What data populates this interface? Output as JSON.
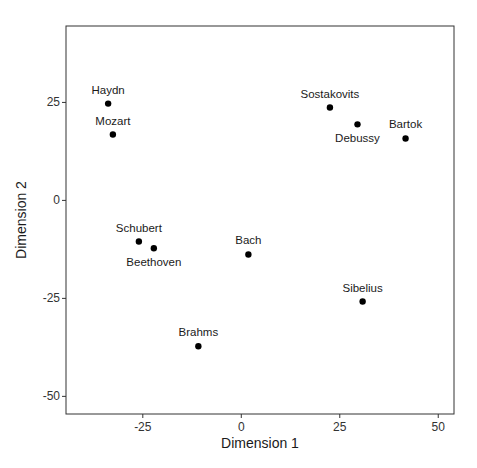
{
  "chart_data": {
    "type": "scatter",
    "title": "",
    "xlabel": "Dimension 1",
    "ylabel": "Dimension 2",
    "xlim": [
      -44.5,
      54
    ],
    "ylim": [
      -54.5,
      44.5
    ],
    "xticks": [
      -25,
      0,
      25,
      50
    ],
    "yticks": [
      -50,
      -25,
      0,
      25
    ],
    "xtick_labels": [
      "-25",
      "0",
      "25",
      "50"
    ],
    "ytick_labels": [
      "-50",
      "-25",
      "0",
      "25"
    ],
    "grid": false,
    "legend": null,
    "points": [
      {
        "label": "Haydn",
        "x": -33.8,
        "y": 24.7,
        "label_pos": "above"
      },
      {
        "label": "Mozart",
        "x": -32.6,
        "y": 16.8,
        "label_pos": "above"
      },
      {
        "label": "Schubert",
        "x": -26.0,
        "y": -10.5,
        "label_pos": "above"
      },
      {
        "label": "Beethoven",
        "x": -22.2,
        "y": -12.2,
        "label_pos": "below"
      },
      {
        "label": "Bach",
        "x": 1.8,
        "y": -13.8,
        "label_pos": "above"
      },
      {
        "label": "Brahms",
        "x": -10.9,
        "y": -37.2,
        "label_pos": "above"
      },
      {
        "label": "Sostakovits",
        "x": 22.5,
        "y": 23.7,
        "label_pos": "above"
      },
      {
        "label": "Debussy",
        "x": 29.5,
        "y": 19.4,
        "label_pos": "below"
      },
      {
        "label": "Bartok",
        "x": 41.7,
        "y": 15.8,
        "label_pos": "above"
      },
      {
        "label": "Sibelius",
        "x": 30.8,
        "y": -25.8,
        "label_pos": "above"
      }
    ],
    "point_color": "#000000"
  }
}
